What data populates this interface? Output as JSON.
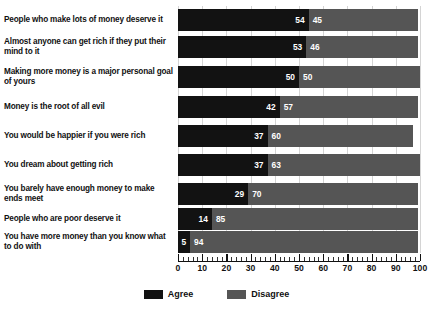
{
  "chart_data": {
    "type": "bar",
    "orientation": "horizontal",
    "stacked": true,
    "title": "",
    "subtitle": "",
    "xlabel": "",
    "ylabel": "",
    "xlim": [
      0,
      100
    ],
    "xticks": [
      0,
      10,
      20,
      30,
      40,
      50,
      60,
      70,
      80,
      90,
      100
    ],
    "xtick_labels": [
      "0",
      "10",
      "20",
      "30",
      "40",
      "50",
      "60",
      "70",
      "80",
      "90",
      "100"
    ],
    "grid": true,
    "legend_position": "bottom-center",
    "categories": [
      "People who make lots of money deserve it",
      "Almost anyone can get rich if they put their mind to it",
      "Making more money is a major personal goal of yours",
      "Money is the root of all evil",
      "You would be happier if you were rich",
      "You dream about getting rich",
      "You barely have enough money to make ends meet",
      "People who are poor deserve it",
      "You have more money than you know what to do with"
    ],
    "series": [
      {
        "name": "Agree",
        "color": "#121212",
        "values": [
          54,
          53,
          50,
          42,
          37,
          37,
          29,
          14,
          5
        ]
      },
      {
        "name": "Disagree",
        "color": "#555555",
        "values": [
          45,
          46,
          50,
          57,
          60,
          63,
          70,
          85,
          94
        ]
      }
    ]
  },
  "legend": {
    "items": [
      {
        "label": "Agree",
        "color": "#121212"
      },
      {
        "label": "Disagree",
        "color": "#555555"
      }
    ]
  }
}
